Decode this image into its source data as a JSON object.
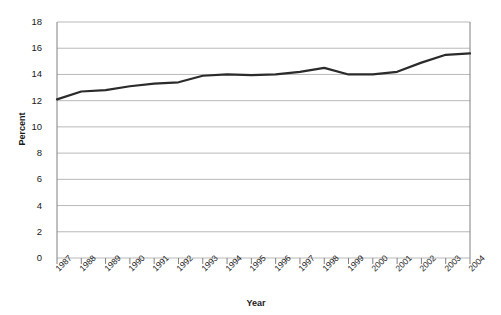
{
  "chart_data": {
    "type": "line",
    "title": "",
    "xlabel": "Year",
    "ylabel": "Percent",
    "categories": [
      "1987",
      "1988",
      "1989",
      "1990",
      "1991",
      "1992",
      "1993",
      "1994",
      "1995",
      "1996",
      "1997",
      "1998",
      "1999",
      "2000",
      "2001",
      "2002",
      "2003",
      "2004"
    ],
    "values": [
      12.1,
      12.7,
      12.8,
      13.1,
      13.3,
      13.4,
      13.9,
      14.0,
      13.95,
      14.0,
      14.2,
      14.5,
      14.0,
      14.0,
      14.2,
      14.9,
      15.5,
      15.6
    ],
    "series": [
      {
        "name": "Percent",
        "values": [
          12.1,
          12.7,
          12.8,
          13.1,
          13.3,
          13.4,
          13.9,
          14.0,
          13.95,
          14.0,
          14.2,
          14.5,
          14.0,
          14.0,
          14.2,
          14.9,
          15.5,
          15.6
        ],
        "color": "#2b2b2b"
      }
    ],
    "ylim": [
      0,
      18
    ],
    "yticks": [
      0,
      2,
      4,
      6,
      8,
      10,
      12,
      14,
      16,
      18
    ],
    "ytick_labels": [
      "0",
      "2",
      "4",
      "6",
      "8",
      "10",
      "12",
      "14",
      "16",
      "18"
    ],
    "grid": "horizontal",
    "legend": "none",
    "line_color": "#2b2b2b",
    "grid_color": "#b9b9b9",
    "axis_color": "#808080",
    "background": "#ffffff",
    "xtick_rotation": -45
  }
}
